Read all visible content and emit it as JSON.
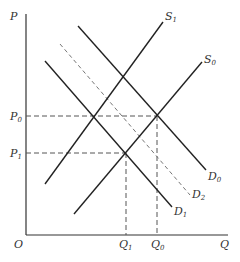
{
  "diagram": {
    "type": "supply-demand",
    "axes": {
      "y_label": "P",
      "x_label": "Q",
      "origin_label": "O"
    },
    "price_levels": [
      {
        "label": "P",
        "sub": "0"
      },
      {
        "label": "P",
        "sub": "1"
      }
    ],
    "quantity_levels": [
      {
        "label": "Q",
        "sub": "1"
      },
      {
        "label": "Q",
        "sub": "0"
      }
    ],
    "curves": [
      {
        "label": "S",
        "sub": "1",
        "style": "solid"
      },
      {
        "label": "S",
        "sub": "0",
        "style": "solid"
      },
      {
        "label": "D",
        "sub": "0",
        "style": "solid"
      },
      {
        "label": "D",
        "sub": "2",
        "style": "dashed"
      },
      {
        "label": "D",
        "sub": "1",
        "style": "solid"
      }
    ]
  }
}
